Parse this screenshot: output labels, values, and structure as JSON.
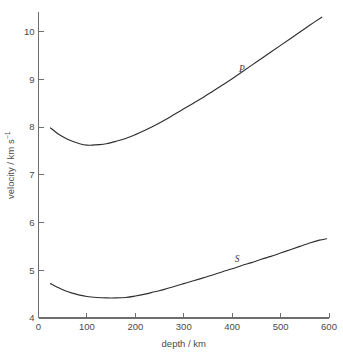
{
  "chart_data": {
    "type": "line",
    "title": "",
    "xlabel": "depth / km",
    "ylabel": "velocity / km s⁻¹",
    "ylabel_main": "velocity / km s",
    "ylabel_exponent": "−1",
    "xlim": [
      0,
      600
    ],
    "ylim": [
      4,
      10.4
    ],
    "xticks": [
      0,
      100,
      200,
      300,
      400,
      500,
      600
    ],
    "xtick_labels": [
      "0",
      "100",
      "200",
      "300",
      "400",
      "500",
      "600"
    ],
    "yticks": [
      4,
      5,
      6,
      7,
      8,
      9,
      10
    ],
    "ytick_labels": [
      "4",
      "5",
      "6",
      "7",
      "8",
      "9",
      "10"
    ],
    "grid": false,
    "legend": "inline-curve-labels",
    "line_color": "#2f2f2f",
    "axis_color": "#6e6e6e",
    "background": "#ffffff",
    "annotations": [
      {
        "text": "P",
        "x": 420,
        "y": 9.15,
        "series": "P"
      },
      {
        "text": "S",
        "x": 410,
        "y": 5.18,
        "series": "S"
      }
    ],
    "series": [
      {
        "name": "P",
        "label": "P",
        "x": [
          25,
          40,
          55,
          70,
          85,
          100,
          110,
          125,
          140,
          160,
          180,
          200,
          220,
          240,
          260,
          280,
          300,
          320,
          340,
          360,
          380,
          400,
          420,
          440,
          460,
          480,
          500,
          520,
          540,
          560,
          585
        ],
        "values": [
          7.98,
          7.86,
          7.77,
          7.7,
          7.65,
          7.62,
          7.62,
          7.63,
          7.65,
          7.7,
          7.76,
          7.84,
          7.93,
          8.03,
          8.14,
          8.26,
          8.38,
          8.5,
          8.62,
          8.75,
          8.88,
          9.01,
          9.15,
          9.29,
          9.43,
          9.57,
          9.71,
          9.85,
          9.99,
          10.13,
          10.3
        ]
      },
      {
        "name": "S",
        "label": "S",
        "x": [
          25,
          40,
          55,
          70,
          85,
          100,
          120,
          140,
          160,
          180,
          200,
          220,
          240,
          260,
          280,
          300,
          320,
          340,
          360,
          380,
          400,
          420,
          440,
          460,
          480,
          500,
          520,
          540,
          560,
          580,
          595
        ],
        "values": [
          4.72,
          4.64,
          4.57,
          4.52,
          4.48,
          4.45,
          4.43,
          4.42,
          4.42,
          4.43,
          4.46,
          4.5,
          4.55,
          4.6,
          4.66,
          4.72,
          4.78,
          4.84,
          4.9,
          4.97,
          5.03,
          5.1,
          5.16,
          5.23,
          5.29,
          5.36,
          5.43,
          5.5,
          5.57,
          5.63,
          5.66
        ]
      }
    ]
  }
}
